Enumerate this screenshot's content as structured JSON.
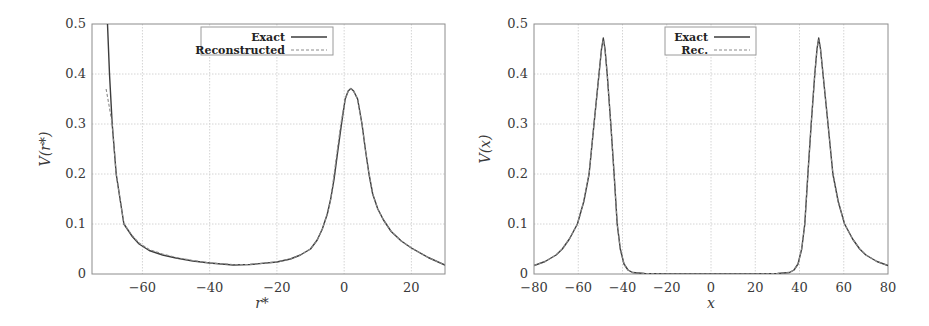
{
  "chart_data": [
    {
      "type": "line",
      "title": "",
      "xlabel": "r*",
      "ylabel": "V(r*)",
      "xlim": [
        -75,
        30
      ],
      "ylim": [
        0,
        0.5
      ],
      "xticks": [
        -60,
        -40,
        -20,
        0,
        20
      ],
      "xtick_labels": [
        "−60",
        "−40",
        "−20",
        "0",
        "20"
      ],
      "yticks": [
        0,
        0.1,
        0.2,
        0.3,
        0.4,
        0.5
      ],
      "ytick_labels": [
        "0",
        "0.1",
        "0.2",
        "0.3",
        "0.4",
        "0.5"
      ],
      "grid": true,
      "legend_position": "upper center",
      "series": [
        {
          "name": "Exact",
          "style": "solid",
          "x": [
            -70.4,
            -69.8,
            -69.0,
            -67.8,
            -65.5,
            -63.0,
            -61.0,
            -58.0,
            -54.0,
            -50.0,
            -45.0,
            -40.0,
            -33.0,
            -28.0,
            -20.0,
            -16.0,
            -13.0,
            -10.0,
            -8.0,
            -6.5,
            -5.0,
            -4.0,
            -3.0,
            -2.0,
            -0.8,
            0.3,
            1.2,
            2.0,
            2.8,
            4.0,
            5.3,
            6.3,
            7.4,
            8.5,
            10.0,
            11.7,
            14.0,
            17.0,
            20.0,
            25.0,
            30.0
          ],
          "values": [
            0.5,
            0.4,
            0.3,
            0.2,
            0.1,
            0.075,
            0.06,
            0.047,
            0.038,
            0.032,
            0.026,
            0.022,
            0.018,
            0.019,
            0.024,
            0.03,
            0.038,
            0.05,
            0.068,
            0.09,
            0.12,
            0.15,
            0.19,
            0.24,
            0.3,
            0.35,
            0.366,
            0.371,
            0.366,
            0.35,
            0.3,
            0.25,
            0.2,
            0.16,
            0.13,
            0.108,
            0.085,
            0.066,
            0.052,
            0.033,
            0.018
          ]
        },
        {
          "name": "Reconstructed",
          "style": "dashed",
          "x": [
            -70.8,
            -70.0,
            -69.0,
            -67.8,
            -65.5,
            -63.0,
            -61.0,
            -58.0,
            -54.0,
            -50.0,
            -45.0,
            -40.0,
            -33.0,
            -28.0,
            -20.0,
            -16.0,
            -13.0,
            -10.0,
            -8.0,
            -6.5,
            -5.0,
            -4.0,
            -3.0,
            -2.0,
            -1.0,
            0.3,
            1.2,
            2.0,
            2.8,
            4.0,
            5.3,
            6.3,
            7.4,
            8.5,
            10.0,
            11.7,
            14.0,
            17.0,
            20.0,
            25.0,
            30.0
          ],
          "values": [
            0.37,
            0.34,
            0.3,
            0.2,
            0.1,
            0.077,
            0.062,
            0.049,
            0.04,
            0.033,
            0.027,
            0.022,
            0.019,
            0.019,
            0.024,
            0.03,
            0.038,
            0.05,
            0.068,
            0.09,
            0.12,
            0.15,
            0.2,
            0.25,
            0.3,
            0.35,
            0.366,
            0.371,
            0.366,
            0.35,
            0.3,
            0.25,
            0.2,
            0.16,
            0.13,
            0.108,
            0.085,
            0.066,
            0.052,
            0.033,
            0.018
          ]
        }
      ]
    },
    {
      "type": "line",
      "title": "",
      "xlabel": "x",
      "ylabel": "V(x)",
      "xlim": [
        -80,
        80
      ],
      "ylim": [
        0,
        0.5
      ],
      "xticks": [
        -80,
        -60,
        -40,
        -20,
        0,
        20,
        40,
        60,
        80
      ],
      "xtick_labels": [
        "−80",
        "−60",
        "−40",
        "−20",
        "0",
        "20",
        "40",
        "60",
        "80"
      ],
      "yticks": [
        0,
        0.1,
        0.2,
        0.3,
        0.4,
        0.5
      ],
      "ytick_labels": [
        "0",
        "0.1",
        "0.2",
        "0.3",
        "0.4",
        "0.5"
      ],
      "grid": true,
      "legend_position": "upper center",
      "series": [
        {
          "name": "Exact",
          "style": "solid",
          "x": [
            -80,
            -75,
            -70,
            -67.2,
            -64,
            -60.4,
            -57.5,
            -55.1,
            -52.9,
            -50.6,
            -49.5,
            -48.7,
            -47.9,
            -46.9,
            -45.3,
            -43.8,
            -42.4,
            -41.0,
            -39.3,
            -37.5,
            -35.5,
            -30,
            -20,
            -10,
            0,
            10,
            20,
            30,
            35.5,
            37.5,
            39.3,
            41.0,
            42.4,
            43.8,
            45.3,
            46.9,
            47.9,
            48.7,
            49.5,
            50.6,
            52.9,
            55.1,
            57.5,
            60.4,
            64,
            67.2,
            70,
            75,
            80
          ],
          "values": [
            0.017,
            0.025,
            0.038,
            0.05,
            0.07,
            0.1,
            0.145,
            0.2,
            0.3,
            0.4,
            0.45,
            0.472,
            0.45,
            0.4,
            0.3,
            0.2,
            0.1,
            0.05,
            0.02,
            0.008,
            0.003,
            0.001,
            0.0,
            0.0,
            0.0,
            0.0,
            0.0,
            0.001,
            0.003,
            0.008,
            0.02,
            0.05,
            0.1,
            0.2,
            0.3,
            0.4,
            0.45,
            0.472,
            0.45,
            0.4,
            0.3,
            0.2,
            0.145,
            0.1,
            0.07,
            0.05,
            0.038,
            0.025,
            0.017
          ]
        },
        {
          "name": "Rec.",
          "style": "dashed",
          "x": [
            -80,
            -75,
            -70,
            -67.2,
            -64,
            -60.4,
            -57.5,
            -55.1,
            -52.9,
            -50.6,
            -49.5,
            -48.7,
            -47.9,
            -46.9,
            -45.3,
            -43.8,
            -42.4,
            -41.0,
            -39.3,
            -37.5,
            -35.5,
            -30,
            -20,
            -10,
            0,
            10,
            20,
            30,
            35.5,
            37.5,
            39.3,
            41.0,
            42.4,
            43.8,
            45.3,
            46.9,
            47.9,
            48.7,
            49.5,
            50.6,
            52.9,
            55.1,
            57.5,
            60.4,
            64,
            67.2,
            70,
            75,
            80
          ],
          "values": [
            0.017,
            0.025,
            0.038,
            0.05,
            0.07,
            0.1,
            0.145,
            0.2,
            0.3,
            0.4,
            0.45,
            0.468,
            0.45,
            0.4,
            0.3,
            0.2,
            0.1,
            0.05,
            0.02,
            0.008,
            0.003,
            0.001,
            0.0,
            0.0,
            0.0,
            0.0,
            0.0,
            0.001,
            0.003,
            0.008,
            0.02,
            0.05,
            0.1,
            0.2,
            0.3,
            0.4,
            0.45,
            0.468,
            0.45,
            0.4,
            0.3,
            0.2,
            0.145,
            0.1,
            0.07,
            0.05,
            0.038,
            0.025,
            0.017
          ]
        }
      ]
    }
  ],
  "plots": [
    {
      "box": {
        "left": 92,
        "top": 24,
        "right": 445,
        "bottom": 274
      },
      "legend_box": {
        "left": 201,
        "top": 27,
        "right": 333,
        "bottom": 55
      },
      "ylabel_pos": {
        "x": 50,
        "y": 149
      },
      "xlabel_pos": {
        "x": 262,
        "y": 308
      }
    },
    {
      "box": {
        "left": 534,
        "top": 24,
        "right": 888,
        "bottom": 274
      },
      "legend_box": {
        "left": 665,
        "top": 27,
        "right": 756,
        "bottom": 55
      },
      "ylabel_pos": {
        "x": 490,
        "y": 149
      },
      "xlabel_pos": {
        "x": 711,
        "y": 308
      }
    }
  ],
  "colors": {
    "curve": "#3c3c3c",
    "dashed": "#8a8a8a",
    "grid": "#d4d4d4",
    "axis": "#8c8c8c"
  }
}
